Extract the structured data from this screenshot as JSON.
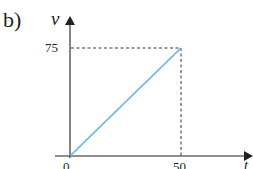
{
  "part_label": "b)",
  "chart_data": {
    "type": "line",
    "title": "",
    "xlabel": "t",
    "ylabel": "v",
    "x": [
      0,
      50
    ],
    "series": [
      {
        "name": "v(t)",
        "values": [
          0,
          75
        ],
        "color": "#5fb3dc"
      }
    ],
    "x_ticks": [
      "0",
      "50"
    ],
    "y_ticks": [
      "75"
    ],
    "xlim": [
      0,
      50
    ],
    "ylim": [
      0,
      75
    ],
    "guides": {
      "dashed_to_point": [
        50,
        75
      ]
    },
    "grid": false,
    "legend": null
  },
  "ticks": {
    "y75": "75",
    "x0": "0",
    "x50": "50"
  },
  "axes": {
    "x_label": "t",
    "y_label": "v"
  }
}
